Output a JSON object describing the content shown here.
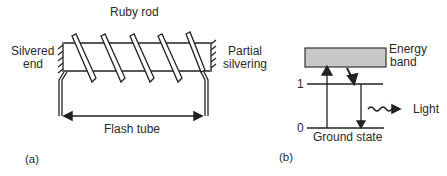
{
  "figure_a": {
    "panel_label": "(a)",
    "labels": {
      "ruby_rod": "Ruby rod",
      "silvered_end_line1": "Silvered",
      "silvered_end_line2": "end",
      "partial_silvering_line1": "Partial",
      "partial_silvering_line2": "silvering",
      "flash_tube": "Flash tube"
    },
    "coil_turns": 5
  },
  "figure_b": {
    "panel_label": "(b)",
    "labels": {
      "energy_band_line1": "Energy",
      "energy_band_line2": "band",
      "level_1": "1",
      "level_0": "0",
      "ground_state": "Ground state",
      "light": "Light"
    },
    "colors": {
      "energy_band_fill": "#c8c8c8",
      "line": "#222222"
    }
  }
}
